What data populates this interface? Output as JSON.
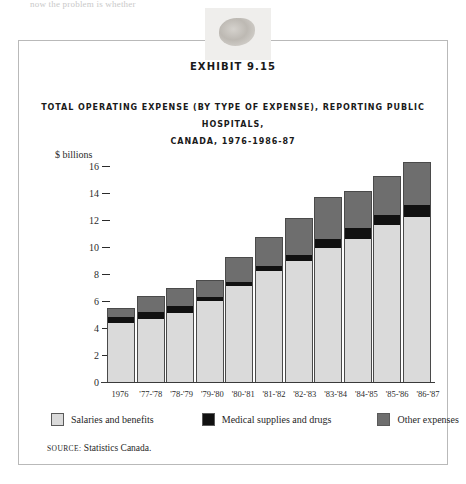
{
  "page": {
    "top_running_text": "now the problem is whether"
  },
  "exhibit": {
    "label": "EXHIBIT 9.15",
    "title_line1": "TOTAL OPERATING EXPENSE (BY TYPE OF EXPENSE), REPORTING PUBLIC HOSPITALS,",
    "title_line2": "CANADA, 1976-1986-87",
    "source_label": "SOURCE:",
    "source_text": "Statistics Canada."
  },
  "colors": {
    "salaries": "#dadada",
    "medical": "#111111",
    "other": "#6e6e6e",
    "border": "#4a4a4a",
    "axis": "#3a3a3a",
    "box_border": "#b9b9b9"
  },
  "chart_data": {
    "type": "bar",
    "subtype": "stacked",
    "title": "TOTAL OPERATING EXPENSE (BY TYPE OF EXPENSE), REPORTING PUBLIC HOSPITALS, CANADA, 1976-1986-87",
    "xlabel": "",
    "ylabel": "$ billions",
    "ylim": [
      0,
      16
    ],
    "yticks": [
      0,
      2,
      4,
      6,
      8,
      10,
      12,
      14,
      16
    ],
    "ytick_labels": [
      "0",
      "2",
      "4",
      "6",
      "8",
      "10",
      "12",
      "14",
      "16"
    ],
    "grid": false,
    "legend_position": "bottom",
    "categories": [
      "1976",
      "'77-'78",
      "'78-'79",
      "'79-'80",
      "'80-'81",
      "'81-'82",
      "'82-'83",
      "'83-'84",
      "'84-'85",
      "'85-'86",
      "'86-'87"
    ],
    "series": [
      {
        "name": "Salaries and benefits",
        "color": "#dadada",
        "values": [
          4.4,
          4.7,
          5.1,
          6.0,
          7.1,
          8.2,
          9.0,
          9.9,
          10.6,
          11.6,
          12.2
        ]
      },
      {
        "name": "Medical supplies and drugs",
        "color": "#111111",
        "values": [
          0.4,
          0.5,
          0.5,
          0.3,
          0.3,
          0.4,
          0.4,
          0.7,
          0.8,
          0.8,
          0.9
        ]
      },
      {
        "name": "Other expenses",
        "color": "#6e6e6e",
        "values": [
          0.6,
          1.1,
          1.3,
          1.2,
          1.8,
          2.1,
          2.7,
          3.0,
          2.7,
          2.8,
          3.1
        ]
      }
    ],
    "totals": [
      5.4,
      6.3,
      6.9,
      7.5,
      9.2,
      10.7,
      12.1,
      13.6,
      14.1,
      15.2,
      16.2
    ]
  }
}
